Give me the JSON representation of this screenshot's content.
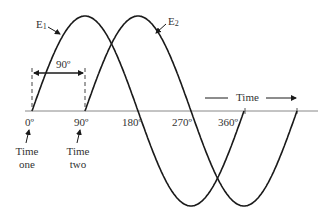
{
  "diagram": {
    "waves": [
      {
        "name": "E1",
        "label_main": "E",
        "label_sub": "1",
        "phase_deg": 0,
        "color": "#1a1a1a"
      },
      {
        "name": "E2",
        "label_main": "E",
        "label_sub": "2",
        "phase_deg": 90,
        "color": "#1a1a1a"
      }
    ],
    "phase_difference_label": "90º",
    "axis": {
      "ticks": [
        "0º",
        "90º",
        "180º",
        "270º",
        "360º"
      ],
      "time_label": "Time"
    },
    "annotations": {
      "time_one": [
        "Time",
        "one"
      ],
      "time_two": [
        "Time",
        "two"
      ]
    },
    "colors": {
      "line": "#1a1a1a",
      "axis": "#888888",
      "text": "#333333"
    }
  }
}
